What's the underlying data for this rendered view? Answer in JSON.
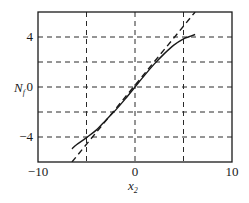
{
  "chart_data": {
    "type": "line",
    "title": "",
    "xlabel": "x₂",
    "xlabel_main": "x",
    "xlabel_sub": "2",
    "ylabel": "N_f",
    "ylabel_main": "N",
    "ylabel_sub": "f",
    "xlim": [
      -10,
      10
    ],
    "ylim": [
      -6,
      6
    ],
    "xticks": [
      -10,
      0,
      10
    ],
    "xtick_labels": [
      "−10",
      "0",
      "10"
    ],
    "yticks": [
      4,
      0,
      -4
    ],
    "ytick_labels": [
      "4",
      "0",
      "−4"
    ],
    "grid": {
      "on": true,
      "style": "dashed",
      "x_lines": [
        -5,
        0,
        5
      ],
      "y_lines": [
        -4,
        -2,
        0,
        2,
        4
      ]
    },
    "legend": null,
    "series": [
      {
        "name": "nonlinear",
        "style": "solid",
        "x": [
          -6.5,
          -6,
          -5,
          -4,
          -3,
          -2,
          -1,
          0,
          1,
          2,
          3,
          4,
          5,
          5.5,
          6.2
        ],
        "y": [
          -4.95,
          -4.6,
          -4.05,
          -3.45,
          -2.65,
          -1.85,
          -0.95,
          0,
          0.95,
          1.85,
          2.65,
          3.35,
          3.85,
          4.0,
          4.2
        ]
      },
      {
        "name": "linear approximation",
        "style": "dashed",
        "x": [
          -6.5,
          6.2
        ],
        "y": [
          -6.0,
          6.0
        ]
      }
    ]
  },
  "colors": {
    "axis": "#1a1a1a",
    "grid": "#2a2a2a",
    "curve": "#1a1a1a",
    "background": "#ffffff"
  }
}
